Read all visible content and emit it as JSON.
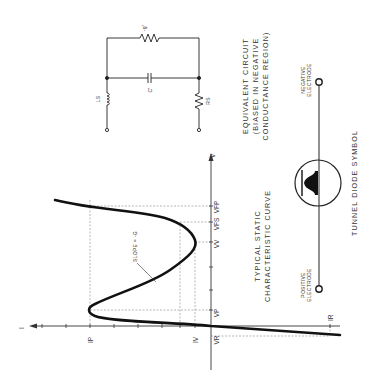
{
  "figure": {
    "orientation": "rotated-90-ccw",
    "colors": {
      "ink": "#1a1a1a",
      "background": "#ffffff",
      "guide": "#888888"
    }
  },
  "characteristic_curve": {
    "title_line1": "TYPICAL STATIC",
    "title_line2": "CHARACTERISTIC CURVE",
    "axis_current_label": "I",
    "axis_voltage_label": "V",
    "slope_annotation": "SLOPE = -G",
    "labels": {
      "peak_current": "IP",
      "valley_current": "IV",
      "reverse_current": "IR",
      "peak_voltage": "VP",
      "valley_voltage": "VV",
      "forward_voltage_at_valley_current": "VFS",
      "forward_voltage_at_peak_current": "VFP",
      "reverse_voltage": "VR"
    }
  },
  "equivalent_circuit": {
    "title_line1": "EQUIVALENT CIRCUIT",
    "title_line2": "(BIASED IN NEGATIVE",
    "title_line3": "CONDUCTANCE REGION)",
    "components": {
      "series_inductance": "LS",
      "series_resistance": "RS",
      "capacitance": "C'",
      "negative_conductance": "-g'"
    }
  },
  "diode_symbol": {
    "title": "TUNNEL DIODE SYMBOL",
    "negative_line1": "NEGATIVE",
    "negative_line2": "ELECTRODE",
    "positive_line1": "POSITIVE",
    "positive_line2": "ELECTRODE"
  }
}
